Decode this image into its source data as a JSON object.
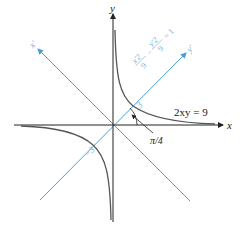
{
  "axes": {
    "x_label": "x",
    "y_label": "y",
    "rotated_x_label": "x'",
    "rotated_y_label": "y'"
  },
  "labels": {
    "equation_original": "2xy = 9",
    "angle": "π/4",
    "tick_positive": "3",
    "tick_negative": "−3",
    "eq_num1": "x'2",
    "eq_den1": "9",
    "eq_minus": "−",
    "eq_num2": "y'2",
    "eq_den2": "9",
    "eq_rhs": "= 1"
  },
  "colors": {
    "axis": "#222222",
    "curve": "#555555",
    "rotated_axis": "#4a9fd4",
    "rotated_text": "#6aaed8"
  }
}
